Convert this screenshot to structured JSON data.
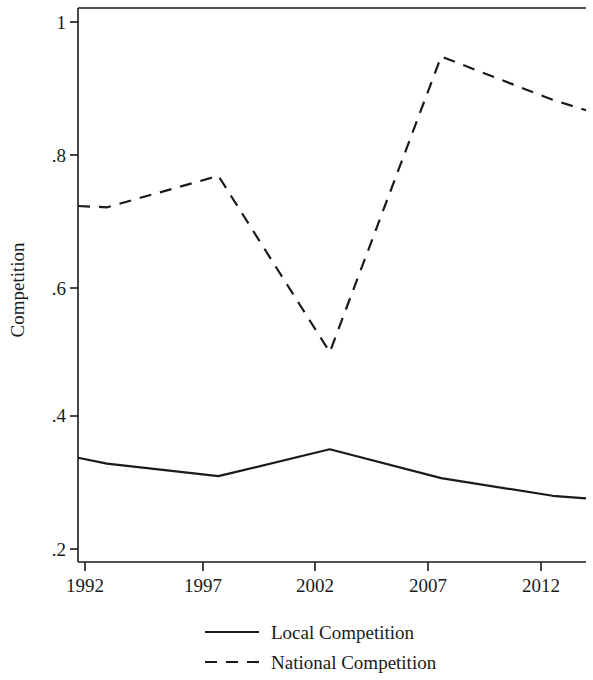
{
  "chart_data": {
    "type": "line",
    "title": "",
    "xlabel": "",
    "ylabel": "Competition",
    "x": [
      1992,
      1997,
      2002,
      2007,
      2012
    ],
    "xtick_labels": [
      "1992",
      "1997",
      "2002",
      "2007",
      "2012"
    ],
    "ytick_labels": [
      ".2",
      ".4",
      ".6",
      ".8",
      "1"
    ],
    "ytick_values": [
      0.2,
      0.4,
      0.6,
      0.8,
      1.0
    ],
    "xlim": [
      1990.7,
      2013.5
    ],
    "ylim": [
      0.175,
      1.02
    ],
    "grid": false,
    "legend_position": "bottom",
    "series": [
      {
        "name": "Local Competition",
        "style": "solid",
        "color": "#1a1a1a",
        "x": [
          1990.7,
          1992,
          1997,
          2002,
          2007,
          2012,
          2013.5
        ],
        "values": [
          0.334,
          0.325,
          0.306,
          0.347,
          0.303,
          0.276,
          0.272
        ]
      },
      {
        "name": "National Competition",
        "style": "dashed",
        "color": "#1a1a1a",
        "x": [
          1990.7,
          1992,
          1997,
          2002,
          2007,
          2012,
          2013.5
        ],
        "values": [
          0.718,
          0.716,
          0.764,
          0.495,
          0.946,
          0.88,
          0.864
        ]
      }
    ],
    "legend": [
      {
        "label": "Local Competition",
        "style": "solid"
      },
      {
        "label": "National Competition",
        "style": "dashed"
      }
    ]
  }
}
